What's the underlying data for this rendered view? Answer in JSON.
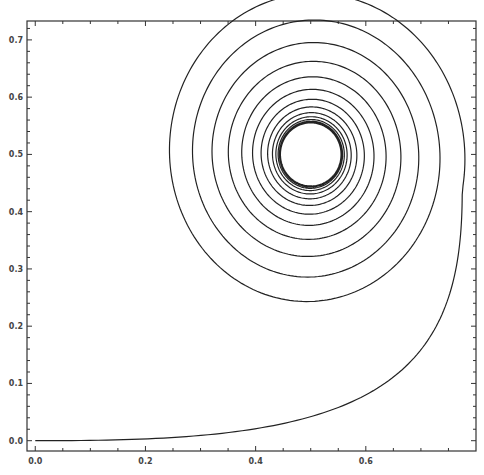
{
  "chart_data": {
    "type": "line",
    "title": "",
    "xlabel": "",
    "ylabel": "",
    "xlim": [
      -0.015,
      0.8
    ],
    "ylim": [
      -0.018,
      0.733
    ],
    "grid": false,
    "legend": null,
    "x_ticks": [
      0.0,
      0.2,
      0.4,
      0.6
    ],
    "x_tick_labels": [
      "0.0",
      "0.2",
      "0.4",
      "0.6"
    ],
    "y_ticks": [
      0.0,
      0.1,
      0.2,
      0.3,
      0.4,
      0.5,
      0.6,
      0.7
    ],
    "y_tick_labels": [
      "0.0",
      "0.1",
      "0.2",
      "0.3",
      "0.4",
      "0.5",
      "0.6",
      "0.7"
    ],
    "x_minor_per_major": 4,
    "y_minor_per_major": 4,
    "series": [
      {
        "name": "trajectory",
        "color": "#222222",
        "description": "Curve starting at origin, sweeping right and up to x≈0.775, then spiraling counter-clockwise inward to a fixed point near (0.5, 0.5)",
        "x": [
          0.0,
          0.1,
          0.2,
          0.3,
          0.4,
          0.5,
          0.6,
          0.68,
          0.73,
          0.76,
          0.775,
          0.77,
          0.74,
          0.68,
          0.6,
          0.53,
          0.45,
          0.38,
          0.33,
          0.315,
          0.33,
          0.38,
          0.45,
          0.5,
          0.56,
          0.62,
          0.66,
          0.67
        ],
        "y": [
          0.0,
          0.005,
          0.02,
          0.05,
          0.09,
          0.14,
          0.21,
          0.28,
          0.34,
          0.39,
          0.44,
          0.5,
          0.57,
          0.64,
          0.69,
          0.705,
          0.695,
          0.66,
          0.6,
          0.52,
          0.43,
          0.37,
          0.33,
          0.325,
          0.33,
          0.37,
          0.43,
          0.5
        ]
      }
    ],
    "spiral": {
      "center": [
        0.5,
        0.5
      ],
      "outer_radius": 0.17,
      "inner_radius": 0.055,
      "turns": 14,
      "end_point": [
        0.505,
        0.445
      ]
    }
  }
}
